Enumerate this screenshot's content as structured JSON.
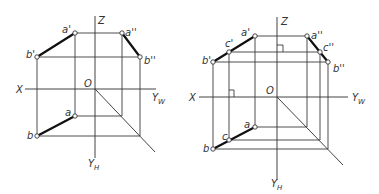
{
  "figure": {
    "left": {
      "axes": {
        "z": "Z",
        "x": "X",
        "yw": "Y",
        "yw_sub": "W",
        "yh": "Y",
        "yh_sub": "H",
        "origin": "O"
      },
      "points": {
        "a_front": "a'",
        "b_front": "b'",
        "a_side": "a''",
        "b_side": "b''",
        "a_top": "a",
        "b_top": "b"
      }
    },
    "right": {
      "axes": {
        "z": "Z",
        "x": "X",
        "yw": "Y",
        "yw_sub": "W",
        "yh": "Y",
        "yh_sub": "H",
        "origin": "O"
      },
      "points": {
        "a_front": "a'",
        "c_front": "c'",
        "b_front": "b'",
        "a_side": "a''",
        "c_side": "c''",
        "b_side": "b''",
        "a_top": "a",
        "c_top": "c",
        "b_top": "b"
      }
    }
  }
}
